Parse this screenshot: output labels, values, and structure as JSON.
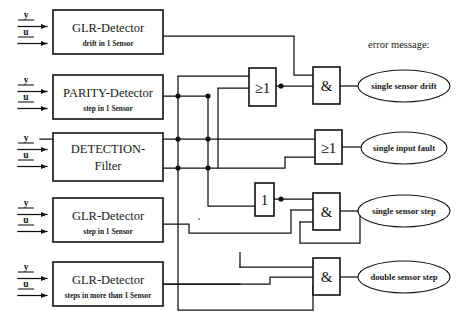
{
  "header": {
    "error_message_label": "error message:"
  },
  "signals": {
    "y_label": "y",
    "u_label": "u"
  },
  "blocks": [
    {
      "id": "glr-drift",
      "title": "GLR-Detector",
      "subtitle": "drift in 1 Sensor",
      "x": 53,
      "y": 10,
      "w": 110,
      "h": 44
    },
    {
      "id": "parity",
      "title": "PARITY-Detector",
      "subtitle": "step in 1 Sensor",
      "x": 53,
      "y": 75,
      "w": 110,
      "h": 44
    },
    {
      "id": "detection-filter",
      "title": "DETECTION-",
      "subtitle": "Filter",
      "x": 53,
      "y": 133,
      "w": 110,
      "h": 48
    },
    {
      "id": "glr-step",
      "title": "GLR-Detector",
      "subtitle": "step in 1 Sensor",
      "x": 53,
      "y": 198,
      "w": 110,
      "h": 44
    },
    {
      "id": "glr-multistep",
      "title": "GLR-Detector",
      "subtitle": "steps in more than 1 Sensor",
      "x": 53,
      "y": 262,
      "w": 110,
      "h": 44
    }
  ],
  "gates": [
    {
      "id": "or-1",
      "label": "≥1",
      "x": 249,
      "y": 68,
      "w": 27,
      "h": 38
    },
    {
      "id": "and-1",
      "label": "&",
      "x": 313,
      "y": 67,
      "w": 27,
      "h": 37
    },
    {
      "id": "or-2",
      "label": "≥1",
      "x": 315,
      "y": 130,
      "w": 27,
      "h": 34
    },
    {
      "id": "not-1",
      "label": "1",
      "x": 255,
      "y": 183,
      "w": 19,
      "h": 33
    },
    {
      "id": "and-2",
      "label": "&",
      "x": 313,
      "y": 193,
      "w": 27,
      "h": 37
    },
    {
      "id": "and-3",
      "label": "&",
      "x": 313,
      "y": 258,
      "w": 27,
      "h": 37
    }
  ],
  "outputs": [
    {
      "id": "out-drift",
      "label": "single sensor drift",
      "cx": 404,
      "cy": 86,
      "rx": 46,
      "ry": 16
    },
    {
      "id": "out-input-fault",
      "label": "single input fault",
      "cx": 404,
      "cy": 148,
      "rx": 43,
      "ry": 16
    },
    {
      "id": "out-sensor-step",
      "label": "single sensor step",
      "cx": 404,
      "cy": 211,
      "rx": 46,
      "ry": 16
    },
    {
      "id": "out-double-step",
      "label": "double sensor step",
      "cx": 404,
      "cy": 277,
      "rx": 46,
      "ry": 16
    }
  ],
  "colors": {
    "stroke": "#111111",
    "background": "#ffffff",
    "text": "#1a1a1a"
  }
}
